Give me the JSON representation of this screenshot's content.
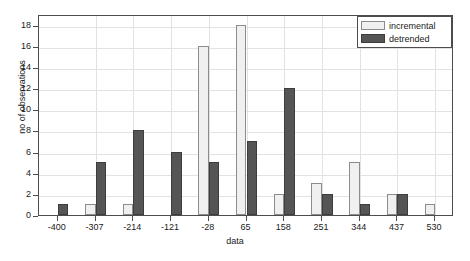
{
  "chart_data": {
    "type": "bar",
    "title": "",
    "xlabel": "data",
    "ylabel": "no of observations",
    "categories": [
      "-400",
      "-307",
      "-214",
      "-121",
      "-28",
      "65",
      "158",
      "251",
      "344",
      "437",
      "530"
    ],
    "series": [
      {
        "name": "incremental",
        "color": "#f0f0f0",
        "values": [
          0,
          1,
          1,
          0,
          16,
          18,
          2,
          3,
          5,
          2,
          1
        ]
      },
      {
        "name": "detrended",
        "color": "#555555",
        "values": [
          1,
          5,
          8,
          6,
          5,
          7,
          12,
          2,
          1,
          2,
          0
        ]
      }
    ],
    "ylim": [
      0,
      19
    ],
    "yticks": [
      0,
      2,
      4,
      6,
      8,
      10,
      12,
      14,
      16,
      18
    ],
    "ytick_labels": [
      "0",
      "2",
      "4",
      "6",
      "8",
      "10",
      "12",
      "14",
      "16",
      "18"
    ],
    "grid": true,
    "legend_position": "top-right"
  },
  "legend": {
    "entries": [
      {
        "label": "incremental",
        "swatch": "incremental"
      },
      {
        "label": "detrended",
        "swatch": "detrended"
      }
    ]
  },
  "colors": {
    "incremental": "#f0f0f0",
    "detrended": "#555555",
    "axis": "#4d4d4d",
    "grid": "#e2e2e2",
    "background": "#ffffff",
    "text": "#1a1a1a"
  }
}
